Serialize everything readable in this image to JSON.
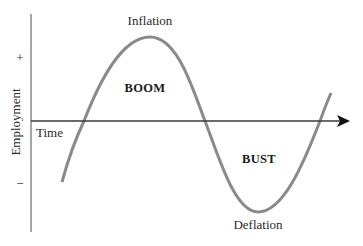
{
  "diagram": {
    "type": "business-cycle",
    "y_axis": {
      "label": "Employment",
      "plus_marker": "+",
      "minus_marker": "−"
    },
    "x_axis": {
      "label": "Time"
    },
    "phases": {
      "boom": "BOOM",
      "bust": "BUST"
    },
    "annotations": {
      "peak": "Inflation",
      "trough": "Deflation"
    },
    "colors": {
      "curve": "#8a8a8a",
      "axis": "#3a3a3a",
      "text": "#2a2a2a"
    }
  }
}
